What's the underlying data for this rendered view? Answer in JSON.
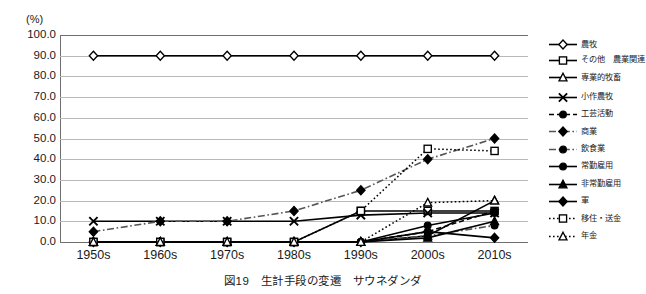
{
  "chart_data": {
    "type": "line",
    "title": "",
    "unit_label": "(%)",
    "xlabel": "",
    "ylabel": "",
    "ylim": [
      0,
      100
    ],
    "ytick_step": 10,
    "grid": true,
    "legend_position": "right",
    "categories": [
      "1950s",
      "1960s",
      "1970s",
      "1980s",
      "1990s",
      "2000s",
      "2010s"
    ],
    "ytick_labels": [
      "100.0",
      "90.0",
      "80.0",
      "70.0",
      "60.0",
      "50.0",
      "40.0",
      "30.0",
      "20.0",
      "10.0",
      "0.0"
    ],
    "series": [
      {
        "name": "農牧",
        "marker": "diamond-open",
        "line": "solid",
        "values": [
          90,
          90,
          90,
          90,
          90,
          90,
          90
        ]
      },
      {
        "name": "その他　農業関連",
        "marker": "square-open",
        "line": "solid",
        "values": [
          0,
          0,
          0,
          0,
          15,
          15,
          15
        ]
      },
      {
        "name": "専業的牧畜",
        "marker": "triangle-open",
        "line": "solid",
        "values": [
          0,
          0,
          0,
          0,
          0,
          3,
          20
        ]
      },
      {
        "name": "小作農牧",
        "marker": "cross",
        "line": "solid",
        "values": [
          10,
          10,
          10,
          10,
          13,
          14,
          14
        ]
      },
      {
        "name": "工芸活動",
        "marker": "circle-filled",
        "line": "dashed",
        "values": [
          0,
          0,
          0,
          0,
          0,
          5,
          15
        ]
      },
      {
        "name": "商業",
        "marker": "diamond-filled",
        "line": "dashdot",
        "values": [
          5,
          10,
          10,
          15,
          25,
          40,
          50
        ]
      },
      {
        "name": "飲食業",
        "marker": "circle-filled",
        "line": "dashdot",
        "values": [
          0,
          0,
          0,
          0,
          0,
          3,
          8
        ]
      },
      {
        "name": "常勤雇用",
        "marker": "circle-filled",
        "line": "solid",
        "values": [
          0,
          0,
          0,
          0,
          0,
          8,
          14
        ]
      },
      {
        "name": "非常勤雇用",
        "marker": "triangle-filled",
        "line": "solid",
        "values": [
          0,
          0,
          0,
          0,
          0,
          2,
          10
        ]
      },
      {
        "name": "軍",
        "marker": "diamond-filled",
        "line": "solid",
        "values": [
          0,
          0,
          0,
          0,
          0,
          5,
          2
        ]
      },
      {
        "name": "移住・送金",
        "marker": "square-open",
        "line": "dotted",
        "values": [
          0,
          0,
          0,
          0,
          15,
          45,
          44
        ]
      },
      {
        "name": "年金",
        "marker": "triangle-open",
        "line": "dotted",
        "values": [
          0,
          0,
          0,
          0,
          0,
          19,
          20
        ]
      }
    ]
  },
  "caption": {
    "figure_number": "図19",
    "text": "図19　生計手段の変遷　サウネダンダ"
  }
}
